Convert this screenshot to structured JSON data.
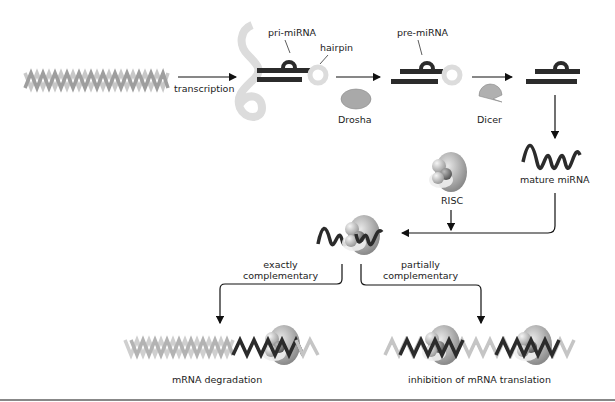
{
  "diagram": {
    "labels": {
      "transcription": "transcription",
      "pri_mirna": "pri-miRNA",
      "hairpin": "hairpin",
      "pre_mirna": "pre-miRNA",
      "drosha": "Drosha",
      "dicer": "Dicer",
      "mature_mirna": "mature miRNA",
      "risc": "RISC",
      "exactly_line1": "exactly",
      "exactly_line2": "complementary",
      "partially_line1": "partially",
      "partially_line2": "complementary",
      "mrna_degradation": "mRNA degradation",
      "inhibition": "inhibition of mRNA translation"
    },
    "colors": {
      "dna_light": "#c8c8c8",
      "dna_dark": "#9a9a9a",
      "rna_dark": "#2b2b2b",
      "loop_light": "#dcdcdc",
      "enzyme": "#a9a9a9",
      "arrow": "#111111",
      "rule": "#888888"
    }
  }
}
